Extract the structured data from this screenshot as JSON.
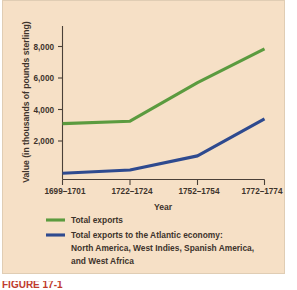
{
  "figure": {
    "background_color": "#f6e0c6",
    "caption_partial": "FIGURE 17-1"
  },
  "chart_data": {
    "type": "line",
    "title": "",
    "xlabel": "Year",
    "ylabel": "Value (in thousands of pounds sterling)",
    "categories": [
      "1699–1701",
      "1722–1724",
      "1752–1754",
      "1772–1774"
    ],
    "series": [
      {
        "name": "Total exports",
        "color": "#5b9b3f",
        "values": [
          3550,
          3700,
          6150,
          8300
        ]
      },
      {
        "name": "Total exports to the Atlantic economy: North America, West Indies, Spanish America, and West Africa",
        "color": "#2e4a8f",
        "values": [
          400,
          600,
          1500,
          3850
        ]
      }
    ],
    "ylim": [
      0,
      9000
    ],
    "yticks": [
      2000,
      4000,
      6000,
      8000
    ],
    "ytick_labels": [
      "2,000",
      "4,000",
      "6,000",
      "8,000"
    ],
    "grid": false,
    "legend_position": "below-axes"
  },
  "legend": {
    "entries": [
      {
        "color": "#5b9b3f",
        "lines": [
          "Total exports"
        ]
      },
      {
        "color": "#2e4a8f",
        "lines": [
          "Total exports to the Atlantic economy:",
          "North America, West Indies, Spanish America,",
          "and West Africa"
        ]
      }
    ]
  }
}
